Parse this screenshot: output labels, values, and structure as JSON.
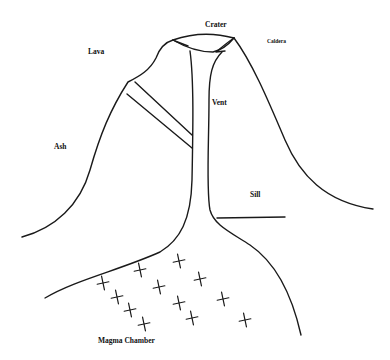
{
  "diagram": {
    "labels": {
      "crater": "Crater",
      "caldera": "Caldera",
      "lava": "Lava",
      "vent": "Vent",
      "ash": "Ash",
      "sill": "Sill",
      "magma_chamber": "Magma Chamber"
    },
    "magma_crosses": 14,
    "line_color": "#1a1a1a",
    "background_color": "#ffffff"
  }
}
